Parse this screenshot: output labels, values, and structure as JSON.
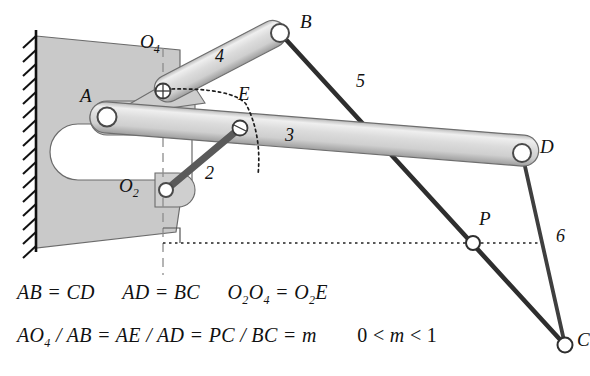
{
  "diagram": {
    "type": "mechanism-kinematic-diagram",
    "colors": {
      "link_light_fill": "#d9d9d9",
      "link_light_edge": "#6e6e6e",
      "link_dark": "#3a3a3a",
      "ground_fill": "#c9c9c9",
      "ground_edge": "#555555",
      "hatch": "#1a1a1a",
      "text": "#111111",
      "dotted": "#222222"
    },
    "joints": [
      {
        "id": "A",
        "label": "A",
        "x": 107,
        "y": 117,
        "style": "open-pin-large"
      },
      {
        "id": "B",
        "label": "B",
        "x": 280,
        "y": 33,
        "style": "open-pin-large"
      },
      {
        "id": "D",
        "label": "D",
        "x": 522,
        "y": 153,
        "style": "open-pin-large"
      },
      {
        "id": "C",
        "label": "C",
        "x": 565,
        "y": 345,
        "style": "open-pin-small"
      },
      {
        "id": "E",
        "label": "E",
        "x": 240,
        "y": 128,
        "style": "crosshair-pin"
      },
      {
        "id": "P",
        "label": "P",
        "x": 473,
        "y": 243,
        "style": "open-pin-small"
      },
      {
        "id": "O2",
        "label": "O",
        "sub": "2",
        "x": 166,
        "y": 190,
        "style": "open-pin-small"
      },
      {
        "id": "O4",
        "label": "O",
        "sub": "4",
        "x": 163,
        "y": 91,
        "style": "crosshair-pin"
      }
    ],
    "links": [
      {
        "number": "2",
        "label_x": 209,
        "label_y": 178,
        "from": "O2",
        "to": "E",
        "style": "dark-bar"
      },
      {
        "number": "3",
        "label_x": 288,
        "label_y": 137,
        "from": "A",
        "to": "D",
        "style": "light-tube"
      },
      {
        "number": "4",
        "label_x": 219,
        "label_y": 57,
        "from": "O4",
        "to": "B",
        "style": "light-tube"
      },
      {
        "number": "5",
        "label_x": 360,
        "label_y": 85,
        "from": "B",
        "to": "C",
        "style": "dark-line"
      },
      {
        "number": "6",
        "label_x": 558,
        "label_y": 238,
        "from": "D",
        "to": "C",
        "style": "dark-line"
      }
    ],
    "annotations": {
      "vertical_dashed_line": "dashed vertical through O4 and O2",
      "horizontal_dotted_line": "dotted horizontal through P",
      "right_angle_marker": "square at intersection of dashed vertical and dotted horizontal",
      "dotted_arc": "arc from O4 through E"
    },
    "equations": {
      "line1": [
        {
          "lhs": "AB",
          "op": "=",
          "rhs": "CD"
        },
        {
          "lhs": "AD",
          "op": "=",
          "rhs": "BC"
        },
        {
          "lhs": "O2O4",
          "op": "=",
          "rhs": "O2E"
        }
      ],
      "line1_text": "AB = CD   AD= BC   O₂O₄ = O₂E",
      "line2_text": "AO₄ / AB = AE / AD = PC / BC = m   0 < m < 1",
      "tokens": {
        "AB": "AB",
        "CD": "CD",
        "AD": "AD",
        "BC": "BC",
        "eq": "=",
        "slash": "/",
        "O": "O",
        "E": "E",
        "two": "2",
        "four": "4",
        "A": "A",
        "P": "P",
        "C": "C",
        "m": "m",
        "zero": "0",
        "lt": "<",
        "one": "1"
      }
    }
  }
}
